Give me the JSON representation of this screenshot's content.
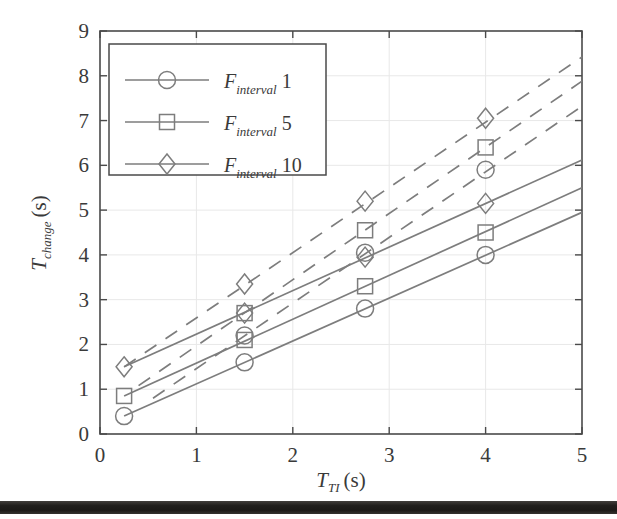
{
  "figure": {
    "kind": "scanned-figure",
    "background_color": "#ffffff",
    "line_color": "#7d7d7d",
    "text_color": "#3a3a3a",
    "axis_color": "#4a4a4a",
    "grid_color": "#e3e3e3",
    "scan_artifact_color": "#221f1d"
  },
  "chart_data": {
    "type": "line",
    "title": "",
    "subtitle": "",
    "xlabel": "T_TI (s)",
    "ylabel": "T_change (s)",
    "xlabel_parts": {
      "base": "T",
      "sub": "TI",
      "unit": "(s)"
    },
    "ylabel_parts": {
      "base": "T",
      "sub": "change",
      "unit": "(s)"
    },
    "xlim": [
      0,
      5
    ],
    "ylim": [
      0,
      9
    ],
    "xticks": [
      0,
      1,
      2,
      3,
      4,
      5
    ],
    "yticks": [
      0,
      1,
      2,
      3,
      4,
      5,
      6,
      7,
      8,
      9
    ],
    "xtick_labels": [
      "0",
      "1",
      "2",
      "3",
      "4",
      "5"
    ],
    "ytick_labels": [
      "0",
      "1",
      "2",
      "3",
      "4",
      "5",
      "6",
      "7",
      "8",
      "9"
    ],
    "grid": true,
    "legend_position": "upper-left",
    "marker_x_values": [
      0.25,
      1.5,
      2.75,
      4.0
    ],
    "series": [
      {
        "name": "F_interval 1 (solid)",
        "legend_key": "F_interval 1",
        "marker": "circle",
        "linestyle": "solid",
        "color": "#7d7d7d",
        "x": [
          0.25,
          1.5,
          2.75,
          4.0
        ],
        "y": [
          0.4,
          1.6,
          2.8,
          4.0
        ],
        "line_endpoints": {
          "x": [
            0.25,
            5.0
          ],
          "y": [
            0.4,
            4.95
          ]
        }
      },
      {
        "name": "F_interval 5 (solid)",
        "legend_key": "F_interval 5",
        "marker": "square",
        "linestyle": "solid",
        "color": "#7d7d7d",
        "x": [
          0.25,
          1.5,
          2.75,
          4.0
        ],
        "y": [
          0.85,
          2.1,
          3.3,
          4.5
        ],
        "line_endpoints": {
          "x": [
            0.25,
            5.0
          ],
          "y": [
            0.85,
            5.5
          ]
        }
      },
      {
        "name": "F_interval 10 (solid)",
        "legend_key": "F_interval 10",
        "marker": "diamond",
        "linestyle": "solid",
        "color": "#7d7d7d",
        "x": [
          0.25,
          1.5,
          2.75,
          4.0
        ],
        "y": [
          1.5,
          2.7,
          3.95,
          5.15
        ],
        "line_endpoints": {
          "x": [
            0.25,
            5.0
          ],
          "y": [
            1.5,
            6.12
          ]
        }
      },
      {
        "name": "F_interval 1 (dashed)",
        "legend_key": "F_interval 1",
        "marker": "circle",
        "linestyle": "dashed",
        "color": "#7d7d7d",
        "x": [
          1.5,
          2.75,
          4.0
        ],
        "y": [
          2.2,
          4.05,
          5.9
        ],
        "line_endpoints": {
          "x": [
            0.55,
            5.0
          ],
          "y": [
            0.8,
            7.32
          ]
        }
      },
      {
        "name": "F_interval 5 (dashed)",
        "legend_key": "F_interval 5",
        "marker": "square",
        "linestyle": "dashed",
        "color": "#7d7d7d",
        "x": [
          1.5,
          2.75,
          4.0
        ],
        "y": [
          2.7,
          4.55,
          6.4
        ],
        "line_endpoints": {
          "x": [
            0.4,
            5.0
          ],
          "y": [
            1.08,
            7.88
          ]
        }
      },
      {
        "name": "F_interval 10 (dashed)",
        "legend_key": "F_interval 10",
        "marker": "diamond",
        "linestyle": "dashed",
        "color": "#7d7d7d",
        "x": [
          1.5,
          2.75,
          4.0
        ],
        "y": [
          3.35,
          5.2,
          7.05
        ],
        "line_endpoints": {
          "x": [
            0.25,
            5.0
          ],
          "y": [
            1.5,
            8.42
          ]
        }
      }
    ],
    "legend_entries": [
      {
        "marker": "circle",
        "base": "F",
        "sub": "interval",
        "value": "1"
      },
      {
        "marker": "square",
        "base": "F",
        "sub": "interval",
        "value": "5"
      },
      {
        "marker": "diamond",
        "base": "F",
        "sub": "interval",
        "value": "10"
      }
    ]
  }
}
